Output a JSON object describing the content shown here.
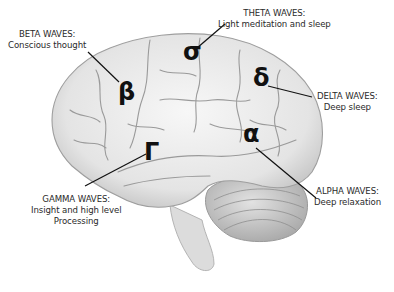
{
  "diagram": {
    "colors": {
      "background": "#ffffff",
      "brain_fill": "#ececec",
      "brain_shade": "#bdbdbd",
      "ink": "#111111",
      "text": "#2a2a2a"
    },
    "waves": [
      {
        "id": "beta",
        "symbol": "β",
        "title": "BETA WAVES:",
        "lines": [
          "Conscious thought"
        ]
      },
      {
        "id": "theta",
        "symbol": "σ",
        "title": "THETA WAVES:",
        "lines": [
          "Light meditation and sleep"
        ]
      },
      {
        "id": "delta",
        "symbol": "δ",
        "title": "DELTA WAVES:",
        "lines": [
          "Deep sleep"
        ]
      },
      {
        "id": "gamma",
        "symbol": "Γ",
        "title": "GAMMA WAVES:",
        "lines": [
          "Insight and high level",
          "Processing"
        ]
      },
      {
        "id": "alpha",
        "symbol": "α",
        "title": "ALPHA WAVES:",
        "lines": [
          "Deep relaxation"
        ]
      }
    ]
  }
}
